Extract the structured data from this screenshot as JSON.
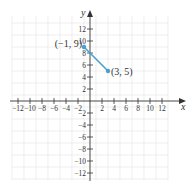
{
  "chart_data": {
    "type": "line",
    "title": "",
    "xlabel": "x",
    "ylabel": "y",
    "xlim": [
      -13.3,
      15.5
    ],
    "ylim": [
      -13.3,
      15
    ],
    "grid": true,
    "grid_step": 2,
    "x_ticks": [
      -12,
      -10,
      -8,
      -6,
      -4,
      -2,
      2,
      4,
      6,
      8,
      10,
      12
    ],
    "y_ticks": [
      12,
      10,
      8,
      6,
      4,
      2,
      -2,
      -4,
      -6,
      -8,
      -10,
      -12
    ],
    "x_tick_labels": [
      "−12",
      "−10",
      "−8",
      "−6",
      "−4",
      "−2",
      "2",
      "4",
      "6",
      "8",
      "10",
      "12"
    ],
    "y_tick_labels": [
      "12",
      "10",
      "8",
      "6",
      "4",
      "2",
      "−2",
      "−4",
      "−6",
      "−8",
      "−10",
      "−12"
    ],
    "series": [
      {
        "name": "segment",
        "color": "#4a9fd0",
        "points": [
          {
            "x": -1,
            "y": 9,
            "label": "(−1, 9)"
          },
          {
            "x": 3,
            "y": 5,
            "label": "(3, 5)"
          }
        ]
      }
    ]
  },
  "colors": {
    "axis": "#333333",
    "grid": "#e6e6e6",
    "segment": "#4a9fd0"
  }
}
